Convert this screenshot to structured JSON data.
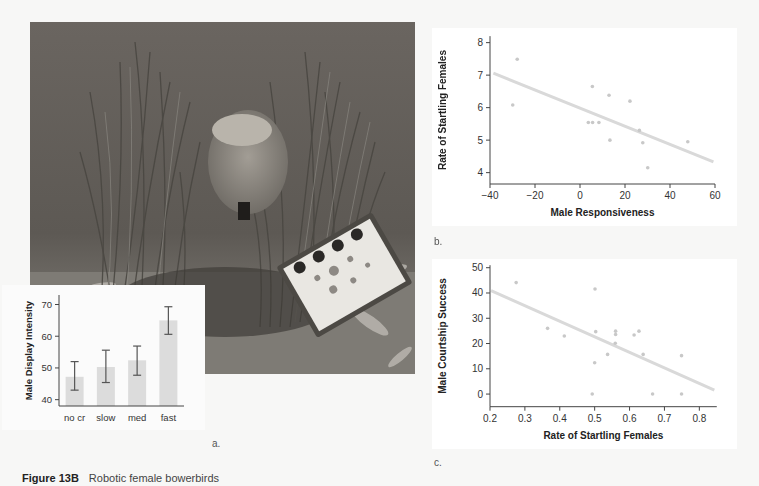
{
  "figure": {
    "caption_label": "Figure 13B",
    "caption_text": "Robotic female bowerbirds",
    "panel_labels": {
      "a": "a.",
      "b": "b.",
      "c": "c."
    }
  },
  "photo": {
    "description": "Robotic female bowerbird inside a grass bower with a remote-control box in the foreground"
  },
  "colors": {
    "bar": "#dcdcdc",
    "errorbar": "#555555",
    "points": "#c8c8c8",
    "regression": "#d9d9d9",
    "axis": "#444444"
  },
  "chart_data": [
    {
      "id": "a",
      "type": "bar",
      "title": "",
      "xlabel": "Robot Crouch (cr) Rate",
      "ylabel": "Male Display Intensity",
      "categories": [
        "no cr",
        "slow",
        "med",
        "fast"
      ],
      "values": [
        47.2,
        50.3,
        52.4,
        65.0
      ],
      "error_low": [
        43.0,
        45.4,
        47.7,
        60.6
      ],
      "error_high": [
        52.0,
        55.6,
        56.9,
        69.3
      ],
      "ylim": [
        38,
        73
      ],
      "yticks": [
        40,
        50,
        60,
        70
      ],
      "grid": false,
      "legend": null
    },
    {
      "id": "b",
      "type": "scatter",
      "title": "",
      "xlabel": "Male Responsiveness",
      "ylabel": "Rate of Startling Females",
      "xlim": [
        -40,
        60
      ],
      "ylim": [
        3.65,
        8.2
      ],
      "xticks": [
        -40,
        -20,
        0,
        20,
        40,
        60
      ],
      "yticks": [
        4,
        5,
        6,
        7,
        8
      ],
      "points": [
        [
          -27.9,
          7.49
        ],
        [
          -29.9,
          6.08
        ],
        [
          5.5,
          6.65
        ],
        [
          12.9,
          6.38
        ],
        [
          22.2,
          6.2
        ],
        [
          3.7,
          5.54
        ],
        [
          5.6,
          5.54
        ],
        [
          8.4,
          5.54
        ],
        [
          13.3,
          5.0
        ],
        [
          26.4,
          5.3
        ],
        [
          27.9,
          4.92
        ],
        [
          30.1,
          4.15
        ],
        [
          47.9,
          4.95
        ]
      ],
      "regression_line": [
        [
          -38.5,
          7.06
        ],
        [
          59.3,
          4.33
        ]
      ],
      "grid": false,
      "legend": null
    },
    {
      "id": "c",
      "type": "scatter",
      "title": "",
      "xlabel": "Rate of Startling Females",
      "ylabel": "Male Courtship Success",
      "xlim": [
        0.2,
        0.85
      ],
      "ylim": [
        -5,
        51
      ],
      "xticks": [
        0.2,
        0.3,
        0.4,
        0.5,
        0.6,
        0.7,
        0.8
      ],
      "yticks": [
        0,
        10,
        20,
        30,
        40,
        50
      ],
      "points": [
        [
          0.275,
          44.1
        ],
        [
          0.365,
          26.0
        ],
        [
          0.413,
          23.0
        ],
        [
          0.501,
          41.6
        ],
        [
          0.503,
          24.7
        ],
        [
          0.5,
          12.4
        ],
        [
          0.493,
          0.0
        ],
        [
          0.537,
          15.7
        ],
        [
          0.56,
          24.9
        ],
        [
          0.56,
          23.6
        ],
        [
          0.559,
          20.1
        ],
        [
          0.613,
          23.4
        ],
        [
          0.627,
          24.9
        ],
        [
          0.639,
          15.7
        ],
        [
          0.666,
          0.0
        ],
        [
          0.749,
          15.2
        ],
        [
          0.749,
          0.0
        ]
      ],
      "regression_line": [
        [
          0.203,
          40.9
        ],
        [
          0.843,
          1.6
        ]
      ],
      "grid": false,
      "legend": null
    }
  ]
}
